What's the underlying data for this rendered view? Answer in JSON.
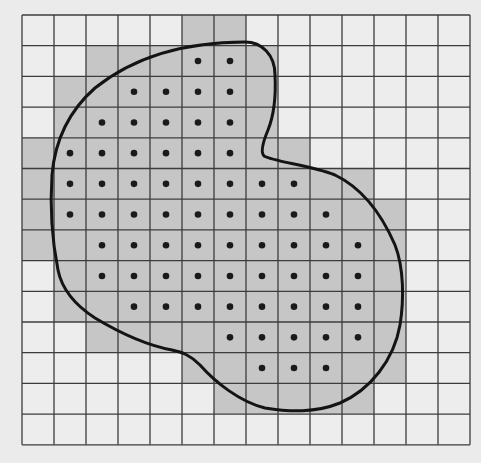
{
  "diagram": {
    "type": "grid-region-approximation",
    "grid": {
      "rows": 14,
      "cols": 14,
      "origin_x": 22,
      "origin_y": 15,
      "cell_w": 32,
      "cell_h": 30.7
    },
    "colors": {
      "background": "#ebebeb",
      "cell_empty": "#ededed",
      "cell_shaded": "#c6c6c6",
      "grid_line": "#3c3c3c",
      "dot": "#1a1a1a",
      "curve": "#141414"
    },
    "shaded_rows": [
      [
        5,
        6
      ],
      [
        2,
        7
      ],
      [
        1,
        7
      ],
      [
        1,
        7
      ],
      [
        0,
        8
      ],
      [
        0,
        10
      ],
      [
        0,
        11
      ],
      [
        0,
        11
      ],
      [
        1,
        11
      ],
      [
        1,
        11
      ],
      [
        2,
        11
      ],
      [
        5,
        11
      ],
      [
        6,
        10
      ],
      null
    ],
    "dot_rows": [
      null,
      [
        5,
        6
      ],
      [
        3,
        6
      ],
      [
        2,
        6
      ],
      [
        1,
        6
      ],
      [
        1,
        8
      ],
      [
        1,
        9
      ],
      [
        2,
        10
      ],
      [
        2,
        10
      ],
      [
        3,
        10
      ],
      [
        6,
        10
      ],
      [
        7,
        9
      ],
      null,
      null
    ],
    "curve_path": "M 245 42 C 262 42, 275 55, 275 75 C 276 95, 274 115, 268 130 C 263 142, 260 152, 264 156 C 275 162, 310 165, 335 175 C 362 188, 382 215, 395 245 C 404 268, 404 300, 400 325 C 394 360, 370 390, 340 403 C 315 413, 290 412, 265 408 C 240 402, 215 382, 200 365 C 190 355, 182 352, 172 350 C 145 345, 115 330, 95 318 C 75 305, 62 290, 58 270 C 52 240, 50 205, 52 175 C 55 140, 70 110, 95 88 C 130 60, 180 42, 245 42 Z"
  }
}
